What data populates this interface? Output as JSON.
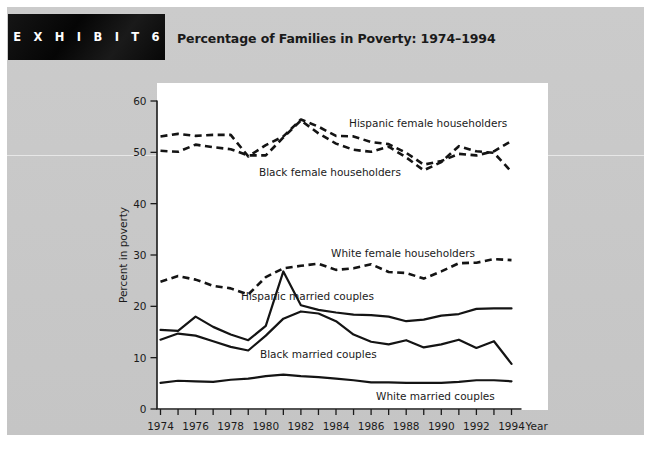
{
  "banner": {
    "label": "E X H I B I T   6"
  },
  "header": {
    "title": "Percentage of Families in Poverty: 1974–1994"
  },
  "chart_data": {
    "type": "line",
    "title": "Percentage of Families in Poverty: 1974–1994",
    "xlabel": "Year",
    "ylabel": "Percent in poverty",
    "xlim": [
      1974,
      1994
    ],
    "ylim": [
      0,
      60
    ],
    "yticks": [
      0,
      10,
      20,
      30,
      40,
      50,
      60
    ],
    "xticks": [
      1974,
      1975,
      1976,
      1977,
      1978,
      1979,
      1980,
      1981,
      1982,
      1983,
      1984,
      1985,
      1986,
      1987,
      1988,
      1989,
      1990,
      1991,
      1992,
      1993,
      1994
    ],
    "xtick_labels": [
      1974,
      1976,
      1978,
      1980,
      1982,
      1984,
      1986,
      1988,
      1990,
      1992,
      1994
    ],
    "grid": false,
    "legend_position": "inline-annotations",
    "x": [
      1974,
      1975,
      1976,
      1977,
      1978,
      1979,
      1980,
      1981,
      1982,
      1983,
      1984,
      1985,
      1986,
      1987,
      1988,
      1989,
      1990,
      1991,
      1992,
      1993,
      1994
    ],
    "series": [
      {
        "name": "Hispanic female householders",
        "style": "dashed",
        "annotation": "Hispanic female householders",
        "values": [
          53.1,
          53.6,
          53.2,
          53.4,
          53.4,
          49.2,
          51.4,
          53.1,
          56.4,
          55.0,
          53.2,
          53.1,
          52.0,
          51.6,
          49.9,
          47.6,
          48.3,
          49.7,
          49.4,
          50.2,
          52.2
        ]
      },
      {
        "name": "Black female householders",
        "style": "dashed",
        "annotation": "Black female householders",
        "values": [
          50.3,
          50.1,
          51.5,
          51.0,
          50.6,
          49.4,
          49.4,
          52.9,
          56.2,
          53.7,
          51.7,
          50.5,
          50.1,
          51.1,
          49.0,
          46.5,
          48.1,
          51.2,
          50.2,
          49.9,
          46.2
        ]
      },
      {
        "name": "White female householders",
        "style": "dashed",
        "annotation": "White female householders",
        "values": [
          24.8,
          25.9,
          25.2,
          24.0,
          23.5,
          22.3,
          25.7,
          27.4,
          27.9,
          28.3,
          27.1,
          27.4,
          28.2,
          26.7,
          26.5,
          25.4,
          26.8,
          28.4,
          28.5,
          29.2,
          29.0
        ]
      },
      {
        "name": "Hispanic married couples",
        "style": "solid",
        "annotation": "Hispanic married couples",
        "values": [
          15.4,
          15.2,
          18.0,
          16.0,
          14.5,
          13.4,
          16.2,
          26.8,
          20.2,
          19.3,
          18.8,
          18.4,
          18.3,
          18.0,
          17.1,
          17.4,
          18.2,
          18.5,
          19.5,
          19.6,
          19.6
        ]
      },
      {
        "name": "Black married couples",
        "style": "solid",
        "annotation": "Black married couples",
        "values": [
          13.5,
          14.7,
          14.3,
          13.2,
          12.1,
          11.4,
          14.3,
          17.6,
          19.0,
          18.6,
          17.1,
          14.5,
          13.1,
          12.6,
          13.4,
          12.0,
          12.6,
          13.5,
          11.9,
          13.2,
          8.8
        ]
      },
      {
        "name": "White married couples",
        "style": "solid",
        "annotation": "White married couples",
        "values": [
          5.1,
          5.5,
          5.4,
          5.3,
          5.7,
          5.9,
          6.4,
          6.7,
          6.4,
          6.2,
          5.9,
          5.6,
          5.2,
          5.2,
          5.1,
          5.1,
          5.1,
          5.3,
          5.6,
          5.6,
          5.4
        ]
      }
    ]
  },
  "annotations": {
    "hispanic_female": "Hispanic female householders",
    "black_female": "Black female householders",
    "white_female": "White female householders",
    "hispanic_married": "Hispanic married couples",
    "black_married": "Black married couples",
    "white_married": "White married couples"
  },
  "colors": {
    "page_background": "#c8c8c8",
    "plot_background": "#ffffff",
    "ink": "#141414",
    "banner_background": "#0d0d0d",
    "banner_text": "#ffffff"
  }
}
